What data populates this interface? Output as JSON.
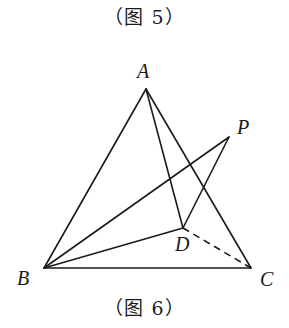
{
  "captions": {
    "top": "（图 5）",
    "bottom": "（图 6）"
  },
  "points": {
    "A": {
      "label": "A",
      "x": 146,
      "y": 89,
      "lx": 137,
      "ly": 78
    },
    "B": {
      "label": "B",
      "x": 44,
      "y": 268,
      "lx": 17,
      "ly": 285
    },
    "C": {
      "label": "C",
      "x": 251,
      "y": 268,
      "lx": 260,
      "ly": 286
    },
    "D": {
      "label": "D",
      "x": 183,
      "y": 228,
      "lx": 175,
      "ly": 251
    },
    "P": {
      "label": "P",
      "x": 229,
      "y": 137,
      "lx": 237,
      "ly": 134
    }
  },
  "segments": [
    {
      "from": "A",
      "to": "B",
      "style": "solid"
    },
    {
      "from": "A",
      "to": "C",
      "style": "solid"
    },
    {
      "from": "B",
      "to": "C",
      "style": "solid"
    },
    {
      "from": "A",
      "to": "D",
      "style": "solid"
    },
    {
      "from": "B",
      "to": "P",
      "style": "solid"
    },
    {
      "from": "B",
      "to": "D",
      "style": "solid"
    },
    {
      "from": "P",
      "to": "D",
      "style": "solid"
    },
    {
      "from": "D",
      "to": "C",
      "style": "dashed"
    }
  ],
  "colors": {
    "stroke": "#1a1a1a",
    "background": "#ffffff"
  }
}
